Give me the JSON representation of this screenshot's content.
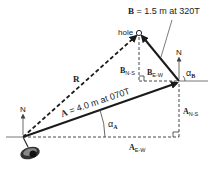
{
  "diagram": {
    "vectors": {
      "A": {
        "symbol": "A",
        "label_rest": " = 4.0 m at 070T",
        "magnitude": "4.0 m",
        "bearing": "070T"
      },
      "B": {
        "symbol": "B",
        "label_rest": " = 1.5 m at 320T",
        "magnitude": "1.5 m",
        "bearing": "320T"
      },
      "R": {
        "symbol": "R"
      }
    },
    "labels": {
      "hole": "hole",
      "north": "N",
      "alpha": "α",
      "alpha_a_sub": "A",
      "alpha_b_sub": "B",
      "a_sym": "A",
      "b_sym": "B",
      "ns_sub": "N-S",
      "ew_sub": "E-W"
    },
    "colors": {
      "ink": "#1a1a1a",
      "dashed": "#333333",
      "ball": "#222222"
    }
  }
}
